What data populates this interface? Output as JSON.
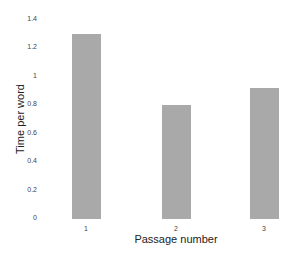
{
  "chart_data": {
    "type": "bar",
    "title": "",
    "xlabel": "Passage number",
    "ylabel": "Time per word",
    "categories": [
      "1",
      "2",
      "3"
    ],
    "values": [
      1.3,
      0.8,
      0.92
    ],
    "ylim": [
      0,
      1.4
    ],
    "yticks": [
      "0",
      "0.2",
      "0.4",
      "0.6",
      "0.8",
      "1",
      "1.2",
      "1.4"
    ],
    "grid": false,
    "legend": null,
    "bar_color": "#a9a9a9"
  }
}
